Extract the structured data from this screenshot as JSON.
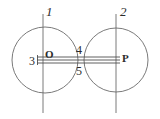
{
  "figure": {
    "background_color": "#ffffff",
    "stroke_color": "#595959",
    "text_color": "#2b2b2b",
    "width": 160,
    "height": 119,
    "labels": {
      "line_1": "1",
      "line_2": "2",
      "left_end": "3",
      "band_top": "4",
      "band_bottom": "5",
      "center_left": "O",
      "center_right": "P"
    },
    "geometry": {
      "left_circle": {
        "cx": 45,
        "cy": 60,
        "r": 33
      },
      "right_circle": {
        "cx": 116,
        "cy": 60,
        "r": 32
      },
      "vertical_line_1": {
        "x": 43,
        "y1": 14,
        "y2": 113
      },
      "vertical_line_2": {
        "x": 116,
        "y1": 14,
        "y2": 113
      },
      "band_top_line": {
        "x1": 37,
        "x2": 120,
        "y": 57
      },
      "band_mid_line": {
        "x1": 37,
        "x2": 120,
        "y": 60
      },
      "band_bottom_line": {
        "x1": 37,
        "x2": 120,
        "y": 63
      },
      "left_tick": {
        "x": 37,
        "y1": 55,
        "y2": 65
      }
    }
  }
}
